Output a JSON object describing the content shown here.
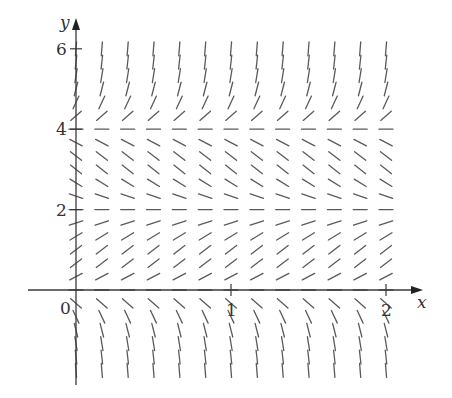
{
  "chart_data": {
    "type": "slope-field",
    "title": "",
    "equation_inferred": "dy/dx = y(y-2)(y-4)",
    "xlabel": "x",
    "ylabel": "y",
    "xlim": [
      -0.31,
      2.24
    ],
    "ylim": [
      -2.4,
      6.8
    ],
    "x_ticks": [
      {
        "value": 0,
        "label": "0"
      },
      {
        "value": 1,
        "label": "1"
      },
      {
        "value": 2,
        "label": "2"
      }
    ],
    "y_ticks": [
      {
        "value": 2,
        "label": "2"
      },
      {
        "value": 4,
        "label": "4"
      },
      {
        "value": 6,
        "label": "6"
      }
    ],
    "grid_x_step": 0.16667,
    "grid_x_range": [
      0,
      2
    ],
    "grid_y_step": 0.33333,
    "grid_y_range": [
      -2,
      6
    ],
    "equilibria": [
      0,
      2,
      4
    ],
    "grid": false,
    "legend": null,
    "colors": {
      "segments": "#5a5a5a",
      "axes": "#3a3a3a"
    }
  },
  "layout": {
    "origin_px": [
      76,
      290
    ],
    "px_per_x": 155,
    "px_per_y": 40.2,
    "segment_len_px": 14,
    "x_axis_px": [
      28,
      423
    ],
    "y_axis_px": [
      385,
      18
    ]
  }
}
